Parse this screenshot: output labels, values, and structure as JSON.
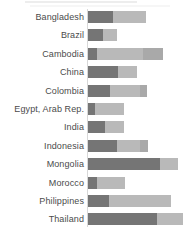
{
  "chart_data": {
    "type": "bar",
    "orientation": "horizontal",
    "stacked": true,
    "title": "",
    "xlabel": "",
    "ylabel": "",
    "xlim": [
      0,
      100
    ],
    "grid": false,
    "legend": "none-visible (cropped)",
    "categories": [
      "Bangladesh",
      "Brazil",
      "Cambodia",
      "China",
      "Colombia",
      "Egypt, Arab Rep.",
      "India",
      "Indonesia",
      "Mongolia",
      "Morocco",
      "Philippines",
      "Thailand"
    ],
    "series": [
      {
        "name": "dark-segment",
        "color": "#757575",
        "values": [
          24,
          14,
          8,
          28,
          21,
          7,
          16,
          27,
          68,
          8,
          20,
          65
        ]
      },
      {
        "name": "light-segment",
        "color": "#b9b9b9",
        "values": [
          31,
          13,
          44,
          18,
          28,
          27,
          18,
          22,
          17,
          27,
          58,
          25
        ]
      },
      {
        "name": "medium-segment",
        "color": "#a9a9a9",
        "values": [
          0,
          0,
          19,
          0,
          7,
          0,
          0,
          8,
          0,
          0,
          0,
          0
        ]
      }
    ],
    "totals": [
      55,
      27,
      71,
      46,
      56,
      34,
      34,
      57,
      85,
      35,
      78,
      90
    ],
    "label_color": "#4b4b4b",
    "axis_line_color": "#d8d8d8",
    "background_color": "#ffffff"
  }
}
